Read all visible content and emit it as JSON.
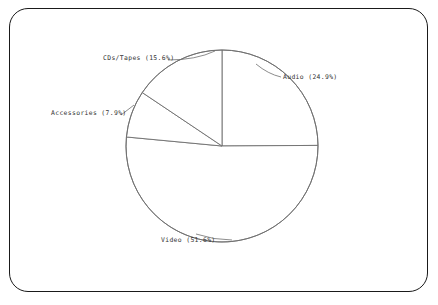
{
  "figure": {
    "background_color": "#ffffff",
    "frame_color": "#1a1a1a",
    "line_color": "#6e6e6e",
    "text_color": "#333333"
  },
  "chart_data": {
    "type": "pie",
    "title": "",
    "subtitle": "",
    "xlabel": "",
    "ylabel": "",
    "legend_position": "none",
    "grid": false,
    "labels_outside": true,
    "start_angle_deg": 90,
    "direction": "clockwise",
    "categories": [
      "Audio",
      "Video",
      "Accessories",
      "CDs/Tapes"
    ],
    "values": [
      24.9,
      51.6,
      7.9,
      15.6
    ],
    "units": "%",
    "slices": [
      {
        "name": "Audio",
        "value": 24.9,
        "label": "Audio (24.9%)",
        "sweep_deg": 89.64,
        "start_deg": 90,
        "end_deg": 0.36
      },
      {
        "name": "Video",
        "value": 51.6,
        "label": "Video (51.6%)",
        "sweep_deg": 185.76,
        "start_deg": 0.36,
        "end_deg": -185.4
      },
      {
        "name": "Accessories",
        "value": 7.9,
        "label": "Accessories (7.9%)",
        "sweep_deg": 28.44,
        "start_deg": -185.4,
        "end_deg": -213.84
      },
      {
        "name": "CDs/Tapes",
        "value": 15.6,
        "label": "CDs/Tapes (15.6%)",
        "sweep_deg": 56.16,
        "start_deg": -213.84,
        "end_deg": -270
      }
    ]
  },
  "labels": {
    "audio": "Audio (24.9%)",
    "video": "Video (51.6%)",
    "accessories": "Accessories (7.9%)",
    "cds_tapes": "CDs/Tapes (15.6%)"
  }
}
